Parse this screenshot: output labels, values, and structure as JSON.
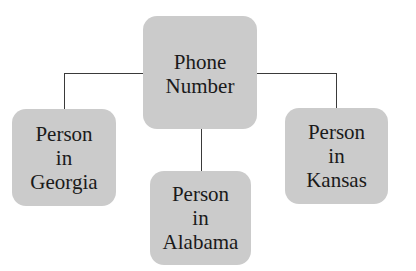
{
  "diagram": {
    "type": "hub-and-spoke",
    "colors": {
      "node_fill": "#cbcbcb",
      "connector": "#3a3a3a",
      "text": "#1a1a1a",
      "background": "#ffffff"
    },
    "center": {
      "lines": [
        "Phone",
        "Number"
      ]
    },
    "children": [
      {
        "id": "georgia",
        "lines": [
          "Person",
          "in",
          "Georgia"
        ]
      },
      {
        "id": "alabama",
        "lines": [
          "Person",
          "in",
          "Alabama"
        ]
      },
      {
        "id": "kansas",
        "lines": [
          "Person",
          "in",
          "Kansas"
        ]
      }
    ],
    "edges": [
      {
        "from": "center",
        "to": "georgia"
      },
      {
        "from": "center",
        "to": "alabama"
      },
      {
        "from": "center",
        "to": "kansas"
      }
    ]
  }
}
